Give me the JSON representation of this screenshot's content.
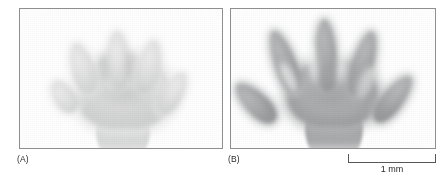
{
  "figure": {
    "type": "micrograph-pair",
    "background_color": "#ffffff",
    "panel_border_color": "#8d8f91"
  },
  "panels": [
    {
      "id": "A",
      "label": "(A)",
      "caption_label": "(A)",
      "description": "pale limb plate with five short digit condensations joined by interdigital webbing",
      "digit_count": 5,
      "tone": "light",
      "specimen_color": "#dcdcdc"
    },
    {
      "id": "B",
      "label": "(B)",
      "caption_label": "(B)",
      "description": "darker, more developed autopod with five elongated, separated digits after interdigital cell death",
      "digit_count": 5,
      "tone": "dark",
      "specimen_color": "#a9aaac"
    }
  ],
  "scale_bar": {
    "label": "1 mm",
    "value": 1,
    "unit": "mm",
    "color": "#555759",
    "style": "bracket"
  }
}
